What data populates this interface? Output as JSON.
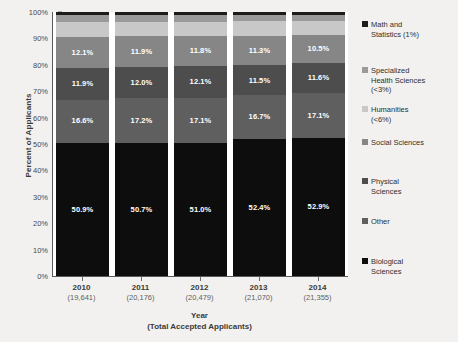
{
  "chart_data": {
    "type": "bar",
    "subtype": "stacked-100-percent",
    "title": "",
    "xlabel": "Year\n(Total Accepted Applicants)",
    "xlabel_line1": "Year",
    "xlabel_line2": "(Total Accepted Applicants)",
    "ylabel": "Percent of Applicants",
    "ylim": [
      0,
      100
    ],
    "ytick_labels": [
      "100%",
      "90%",
      "80%",
      "70%",
      "60%",
      "50%",
      "40%",
      "30%",
      "20%",
      "10%",
      "0%"
    ],
    "ytick_values": [
      100,
      90,
      80,
      70,
      60,
      50,
      40,
      30,
      20,
      10,
      0
    ],
    "grid": false,
    "legend_position": "right",
    "categories": [
      "2010",
      "2011",
      "2012",
      "2013",
      "2014"
    ],
    "category_sublabels": [
      "(19,641)",
      "(20,176)",
      "(20,479)",
      "(21,070)",
      "(21,355)"
    ],
    "stack_order_top_to_bottom": [
      "Math and Statistics (1%)",
      "Specialized Health Sciences (<3%)",
      "Humanities (<6%)",
      "Social Sciences",
      "Physical Sciences",
      "Other",
      "Biological Sciences"
    ],
    "series": [
      {
        "name": "Math and Statistics (1%)",
        "short": "Math and Statistics",
        "color": "#1c1c1c",
        "values": [
          1.0,
          1.0,
          1.0,
          1.0,
          1.0
        ],
        "show_labels": false
      },
      {
        "name": "Specialized Health Sciences (<3%)",
        "short": "Specialized Health Sciences",
        "color": "#9a9a9a",
        "values": [
          2.8,
          2.8,
          2.7,
          2.6,
          2.4
        ],
        "show_labels": false
      },
      {
        "name": "Humanities (<6%)",
        "short": "Humanities",
        "color": "#c8c8c8",
        "values": [
          5.7,
          5.4,
          5.3,
          5.5,
          5.5
        ],
        "show_labels": false
      },
      {
        "name": "Social Sciences",
        "short": "Social Sciences",
        "color": "#868686",
        "values": [
          12.1,
          11.9,
          11.8,
          11.3,
          10.5
        ],
        "labels": [
          "12.1%",
          "11.9%",
          "11.8%",
          "11.3%",
          "10.5%"
        ],
        "show_labels": true
      },
      {
        "name": "Physical Sciences",
        "short": "Physical Sciences",
        "color": "#4d4d4d",
        "values": [
          11.9,
          12.0,
          12.1,
          11.5,
          11.6
        ],
        "labels": [
          "11.9%",
          "12.0%",
          "12.1%",
          "11.5%",
          "11.6%"
        ],
        "show_labels": true
      },
      {
        "name": "Other",
        "short": "Other",
        "color": "#5f5f5f",
        "values": [
          16.6,
          17.2,
          17.1,
          16.7,
          17.1
        ],
        "labels": [
          "16.6%",
          "17.2%",
          "17.1%",
          "16.7%",
          "17.1%"
        ],
        "show_labels": true
      },
      {
        "name": "Biological Sciences",
        "short": "Biological Sciences",
        "color": "#0d0d0d",
        "values": [
          50.9,
          50.7,
          51.0,
          52.4,
          52.9
        ],
        "labels": [
          "50.9%",
          "50.7%",
          "51.0%",
          "52.4%",
          "52.9%"
        ],
        "show_labels": true
      }
    ]
  },
  "legend": {
    "entries": [
      {
        "label": "Math and Statistics (1%)",
        "line1": "Math and",
        "line2": "Statistics (1%)",
        "line3": "",
        "color": "#1c1c1c",
        "top": 6
      },
      {
        "label": "Specialized Health Sciences (<3%)",
        "line1": "Specialized",
        "line2": "Health Sciences",
        "line3": "(<3%)",
        "color": "#9a9a9a",
        "top": 52
      },
      {
        "label": "Humanities (<6%)",
        "line1": "Humanities",
        "line2": "(<6%)",
        "line3": "",
        "color": "#c8c8c8",
        "top": 91
      },
      {
        "label": "Social Sciences",
        "line1": "Social Sciences",
        "line2": "",
        "line3": "",
        "color": "#868686",
        "top": 124
      },
      {
        "label": "Physical Sciences",
        "line1": "Physical",
        "line2": "Sciences",
        "line3": "",
        "color": "#4d4d4d",
        "top": 163
      },
      {
        "label": "Other",
        "line1": "Other",
        "line2": "",
        "line3": "",
        "color": "#5f5f5f",
        "top": 203
      },
      {
        "label": "Biological Sciences",
        "line1": "Biological",
        "line2": "Sciences",
        "line3": "",
        "color": "#0d0d0d",
        "top": 243
      }
    ]
  },
  "colors": {
    "page_background": "#f2f1ef",
    "plot_background": "#ffffff",
    "axis": "#5a5a5a",
    "tick_text": "#4a4a4a",
    "title_text": "#3a3a3a"
  }
}
